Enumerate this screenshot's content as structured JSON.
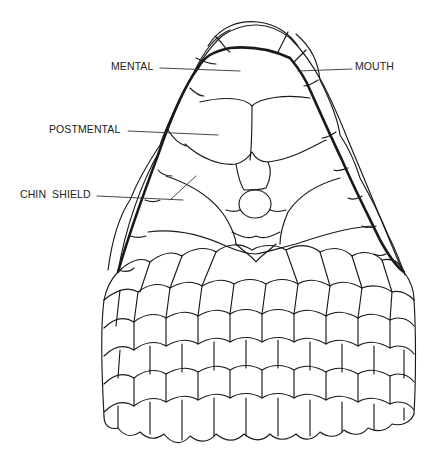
{
  "figure": {
    "type": "anatomical line drawing",
    "background": "#ffffff",
    "line_color": "#1a1a1a"
  },
  "labels": {
    "mental": "MENTAL",
    "postmental": "POSTMENTAL",
    "chin_shield": "CHIN  SHIELD",
    "mouth": "MOUTH"
  }
}
